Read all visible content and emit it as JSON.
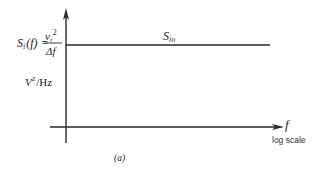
{
  "diagram": {
    "caption": "(a)",
    "y_axis": {
      "quantity_label": "S",
      "quantity_subscript": "i",
      "quantity_arg": "(f) =",
      "numerator_var": "v",
      "numerator_subscript": "i",
      "numerator_exponent": "2",
      "denominator": "Δf",
      "unit_base": "V",
      "unit_exponent": "2",
      "unit_rest": "/Hz"
    },
    "x_axis": {
      "label": "f",
      "scale_note": "log scale"
    },
    "curve": {
      "label_base": "S",
      "label_subscript": "io",
      "shape": "constant (flat) spectral density across frequency"
    }
  }
}
